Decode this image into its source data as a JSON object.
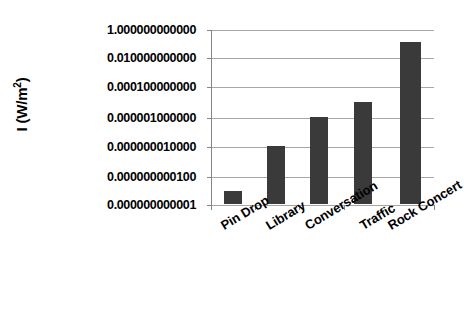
{
  "chart_data": {
    "type": "bar",
    "title": "",
    "subtitle": "",
    "xlabel": "",
    "ylabel": "I (W/m2)",
    "ylabel_text": "I (W/m",
    "ylabel_sup": "2",
    "ylabel_tail": ")",
    "categories": [
      "Pin Drop",
      "Library",
      "Conversation",
      "Traffic",
      "Rock Concert"
    ],
    "values": [
      1e-11,
      1e-08,
      1e-06,
      1e-05,
      0.1
    ],
    "value_labels": [
      "0.000000000010",
      "0.000000010000",
      "0.000001000000",
      "0.000010000000",
      "0.100000000000"
    ],
    "yscale": "log",
    "ylim": [
      1e-12,
      1
    ],
    "ytick_values": [
      1,
      0.01,
      0.0001,
      1e-06,
      1e-08,
      1e-10,
      1e-12
    ],
    "ytick_labels": [
      "1.000000000000",
      "0.010000000000",
      "0.000100000000",
      "0.000001000000",
      "0.000000010000",
      "0.000000000100",
      "0.000000000001"
    ],
    "grid": true,
    "legend": false,
    "legend_position": "none",
    "bar_color": "#3a3a3a",
    "gridline_color": "#a6a6a6",
    "axis_color": "#868686",
    "background_color": "#ffffff",
    "annotations": []
  },
  "layout": {
    "plot_left": 211,
    "plot_top": 30,
    "plot_width": 223,
    "plot_height": 175,
    "gridline_tops": [
      0,
      28,
      57,
      88,
      117,
      147,
      175
    ],
    "bar_geometry": [
      {
        "left": 13,
        "width": 18,
        "top": 162
      },
      {
        "left": 56,
        "width": 18,
        "top": 117
      },
      {
        "left": 99,
        "width": 18,
        "top": 88
      },
      {
        "left": 143,
        "width": 18,
        "top": 73
      },
      {
        "left": 189,
        "width": 21,
        "top": 13
      }
    ],
    "x_tick_marks": [
      0,
      44,
      88,
      133,
      178,
      223
    ],
    "x_label_positions": [
      {
        "left": 218,
        "top": 14
      },
      {
        "left": 263,
        "top": 14
      },
      {
        "left": 302,
        "top": 14
      },
      {
        "left": 357,
        "top": 14
      },
      {
        "left": 385,
        "top": 14
      }
    ]
  }
}
